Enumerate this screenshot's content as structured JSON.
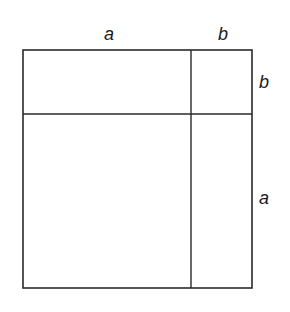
{
  "diagram": {
    "stroke_color": "#2a2a2a",
    "top_labels": [
      "a",
      "b"
    ],
    "right_labels": [
      "b",
      "a"
    ],
    "regions": [
      {
        "name": "a-by-b",
        "position": "top-left"
      },
      {
        "name": "b-by-b",
        "position": "top-right"
      },
      {
        "name": "a-by-a",
        "position": "bottom-left"
      },
      {
        "name": "b-by-a",
        "position": "bottom-right"
      }
    ]
  }
}
